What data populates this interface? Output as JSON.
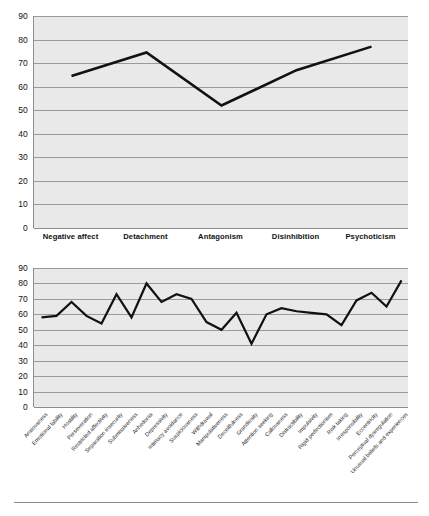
{
  "figure": {
    "background_color": "#ffffff",
    "plot_background_color": "#e9e9e9",
    "line_color": "#111111",
    "gridline_color": "#9a9a9a",
    "axis_color": "#8d8d8d"
  },
  "chart_data": [
    {
      "id": "domains",
      "type": "line",
      "title": "",
      "xlabel": "",
      "ylabel": "",
      "ylim": [
        0,
        90
      ],
      "ytick_step": 10,
      "yticks": [
        90,
        80,
        70,
        60,
        50,
        40,
        30,
        20,
        10,
        0
      ],
      "grid": true,
      "legend": "none",
      "categories": [
        "Negative affect",
        "Detachment",
        "Antagonism",
        "Disinhibition",
        "Psychoticism"
      ],
      "values": [
        64.5,
        74.5,
        52.0,
        67.0,
        77.0
      ]
    },
    {
      "id": "facets",
      "type": "line",
      "title": "",
      "xlabel": "",
      "ylabel": "",
      "ylim": [
        0,
        90
      ],
      "ytick_step": 10,
      "yticks": [
        90,
        80,
        70,
        60,
        50,
        40,
        30,
        20,
        10,
        0
      ],
      "grid": true,
      "legend": "none",
      "categories": [
        "Anxiousness",
        "Emotional lability",
        "Hostility",
        "Perseveration",
        "Restricted affectivity",
        "Separation insecurity",
        "Submissiveness",
        "Anhedonia",
        "Depressivity",
        "Intimacy avoidance",
        "Suspiciousness",
        "Withdrawal",
        "Manipulativeness",
        "Deceitfulness",
        "Grandiosity",
        "Attention seeking",
        "Callousness",
        "Distractibility",
        "Impulsivity",
        "Rigid perfectionism",
        "Risk taking",
        "Irresponsibility",
        "Eccentricity",
        "Perceptual dysregulation",
        "Unusual beliefs and experiences"
      ],
      "values": [
        58,
        59,
        68,
        59,
        54,
        73,
        58,
        80,
        68,
        73,
        70,
        55,
        50,
        61,
        41,
        60,
        64,
        62,
        61,
        60,
        53,
        69,
        74,
        65,
        82
      ],
      "values_tail": [
        65
      ]
    }
  ]
}
